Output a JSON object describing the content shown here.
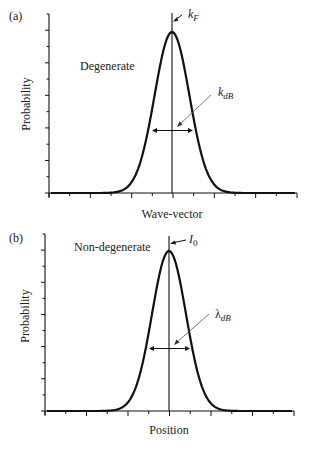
{
  "chart_data": [
    {
      "type": "line",
      "panel_label": "(a)",
      "title": "",
      "annotation_text": "Degenerate",
      "xlabel": "Wave-vector",
      "ylabel": "Probability",
      "center_marker": {
        "label": "k",
        "subscript": "F"
      },
      "width_marker": {
        "label": "k",
        "subscript": "dB"
      },
      "x_ticks_major": 6,
      "y_ticks_major": 5,
      "grid": false,
      "curve": "gaussian",
      "series": [
        {
          "name": "probability",
          "shape": "gaussian peak centered on k_F",
          "peak_relative": 1.0,
          "fwhm_relative": 0.165
        }
      ]
    },
    {
      "type": "line",
      "panel_label": "(b)",
      "title": "",
      "annotation_text": "Non-degenerate",
      "xlabel": "Position",
      "ylabel": "Probability",
      "center_marker": {
        "label": "I",
        "subscript": "0"
      },
      "width_marker": {
        "label": "λ",
        "subscript": "dB"
      },
      "x_ticks_major": 6,
      "y_ticks_major": 5,
      "grid": false,
      "curve": "gaussian",
      "series": [
        {
          "name": "probability",
          "shape": "gaussian peak centered on I_0",
          "peak_relative": 1.0,
          "fwhm_relative": 0.165
        }
      ]
    }
  ],
  "panels": {
    "a": {
      "label": "(a)",
      "state": "Degenerate",
      "xlabel": "Wave-vector",
      "ylabel": "Probability",
      "center_sym": "k",
      "center_sub": "F",
      "width_sym": "k",
      "width_sub": "dB"
    },
    "b": {
      "label": "(b)",
      "state": "Non-degenerate",
      "xlabel": "Position",
      "ylabel": "Probability",
      "center_sym": "I",
      "center_sub": "0",
      "width_sym": "λ",
      "width_sub": "dB"
    }
  }
}
